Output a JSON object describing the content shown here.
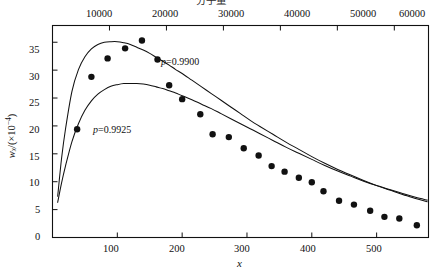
{
  "figure": {
    "background": "#ffffff",
    "ink": "#111111"
  },
  "chart_data": {
    "type": "scatter",
    "title": "",
    "top_axis_title": "分子量",
    "xlabel": "x",
    "ylabel_main": "w",
    "ylabel_sub": "x",
    "ylabel_rest": "/(×10",
    "ylabel_exp": "−4",
    "ylabel_close": ")",
    "ylabel_full": "w_x/(×10⁻⁴)",
    "xlim": [
      0,
      580
    ],
    "ylim": [
      0,
      38
    ],
    "top_xlim": [
      0,
      66000
    ],
    "grid": false,
    "legend": "inline-annotations",
    "xticks": [
      100,
      200,
      300,
      400,
      500
    ],
    "xtick_labels": [
      "100",
      "200",
      "300",
      "400",
      "500"
    ],
    "yticks": [
      0,
      5,
      10,
      15,
      20,
      25,
      30,
      35
    ],
    "ytick_labels": [
      "0",
      "5",
      "10",
      "15",
      "20",
      "25",
      "30",
      "35"
    ],
    "top_xticks": [
      10000,
      20000,
      30000,
      40000,
      50000,
      60000
    ],
    "top_xtick_labels": [
      "10000",
      "20000",
      "30000",
      "40000",
      "50000",
      "60000"
    ],
    "annotations": [
      {
        "text": "p=0.9900",
        "var": "p",
        "value": "=0.9900",
        "x": 205,
        "y": 31.5
      },
      {
        "text": "p=0.9925",
        "var": "p",
        "value": "=0.9925",
        "x": 120,
        "y": 19.2
      }
    ],
    "series": [
      {
        "name": "p=0.9900",
        "kind": "line",
        "p": 0.99,
        "x": [
          8,
          14,
          20,
          30,
          40,
          50,
          60,
          70,
          80,
          90,
          100,
          110,
          120,
          130,
          140,
          150,
          160,
          170,
          180,
          190,
          200,
          215,
          230,
          245,
          260,
          275,
          290,
          305,
          320,
          340,
          360,
          380,
          400,
          420,
          440,
          460,
          480,
          500,
          520,
          540,
          560,
          578
        ],
        "y": [
          7.4,
          14.2,
          19.4,
          26.2,
          30.1,
          32.4,
          33.8,
          34.6,
          35.0,
          35.1,
          35.1,
          34.9,
          34.6,
          34.1,
          33.6,
          33.0,
          32.3,
          31.6,
          30.9,
          30.1,
          29.4,
          28.2,
          27.0,
          25.8,
          24.6,
          23.4,
          22.2,
          21.0,
          19.9,
          18.5,
          17.1,
          15.8,
          14.5,
          13.3,
          12.2,
          11.2,
          10.2,
          9.3,
          8.5,
          7.7,
          7.0,
          6.4
        ]
      },
      {
        "name": "p=0.9925",
        "kind": "line",
        "p": 0.9925,
        "x": [
          8,
          14,
          20,
          30,
          40,
          50,
          60,
          70,
          80,
          90,
          100,
          110,
          120,
          130,
          140,
          150,
          160,
          170,
          180,
          190,
          200,
          215,
          230,
          245,
          260,
          275,
          290,
          305,
          320,
          340,
          360,
          380,
          400,
          420,
          440,
          460,
          480,
          500,
          520,
          540,
          560,
          578
        ],
        "y": [
          6.3,
          9.8,
          12.8,
          17.2,
          20.4,
          22.8,
          24.5,
          25.7,
          26.5,
          27.1,
          27.4,
          27.6,
          27.6,
          27.6,
          27.5,
          27.3,
          27.0,
          26.7,
          26.3,
          25.9,
          25.4,
          24.7,
          23.9,
          23.1,
          22.2,
          21.3,
          20.4,
          19.5,
          18.6,
          17.4,
          16.2,
          15.1,
          14.0,
          12.9,
          11.9,
          11.0,
          10.1,
          9.3,
          8.6,
          7.9,
          7.2,
          6.7
        ]
      },
      {
        "name": "experimental points",
        "kind": "scatter",
        "marker": "filled-circle",
        "x": [
          38,
          60,
          85,
          112,
          138,
          162,
          180,
          200,
          228,
          247,
          272,
          295,
          318,
          338,
          358,
          380,
          400,
          418,
          442,
          465,
          490,
          512,
          535,
          562
        ],
        "y": [
          19.4,
          28.8,
          32.1,
          33.9,
          35.3,
          31.9,
          27.3,
          24.8,
          22.1,
          18.5,
          18.0,
          16.0,
          14.7,
          12.8,
          11.8,
          10.7,
          9.9,
          8.3,
          6.6,
          5.9,
          4.8,
          3.7,
          3.4,
          2.2
        ]
      }
    ]
  }
}
